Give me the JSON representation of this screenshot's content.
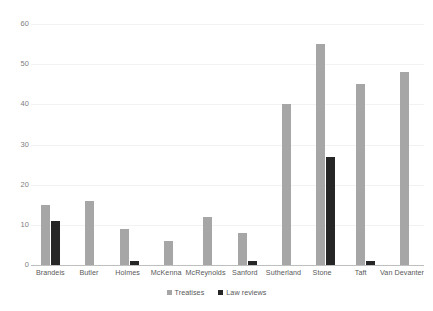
{
  "chart_data": {
    "type": "bar",
    "title": "",
    "subtitle": "",
    "xlabel": "",
    "ylabel": "",
    "ylim": [
      0,
      60
    ],
    "ytick_values": [
      60,
      50,
      40,
      30,
      20,
      10,
      0
    ],
    "ytick_labels": [
      "60",
      "50",
      "40",
      "30",
      "20",
      "10",
      "0"
    ],
    "grid": true,
    "grid_axis": "y",
    "legend_position": "bottom-center",
    "categories": [
      "Brandeis",
      "Butler",
      "Holmes",
      "McKenna",
      "McReynolds",
      "Sanford",
      "Sutherland",
      "Stone",
      "Taft",
      "Van Devanter"
    ],
    "series": [
      {
        "name": "Treatises",
        "color": "#a6a6a6",
        "values": [
          15,
          16,
          9,
          6,
          12,
          8,
          40,
          55,
          45,
          48
        ]
      },
      {
        "name": "Law reviews",
        "color": "#262626",
        "values": [
          11,
          0,
          1,
          0,
          0,
          1,
          0,
          27,
          1,
          0
        ]
      }
    ]
  },
  "colors": {
    "treatises": "#a6a6a6",
    "law_reviews": "#262626",
    "gridline": "#f2f2f2",
    "axis_line": "#bfbfbf",
    "tick_text": "#808080",
    "label_text": "#595959",
    "background": "#ffffff"
  }
}
